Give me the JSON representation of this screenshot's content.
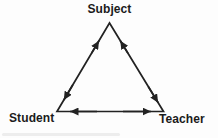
{
  "diagram": {
    "type": "triangle-relationship-diagram",
    "nodes": {
      "top": {
        "label": "Subject"
      },
      "bottom_left": {
        "label": "Student"
      },
      "bottom_right": {
        "label": "Teacher"
      }
    },
    "edges": [
      {
        "from": "Student",
        "to": "Subject",
        "direction": "bidirectional"
      },
      {
        "from": "Teacher",
        "to": "Subject",
        "direction": "bidirectional"
      },
      {
        "from": "Student",
        "to": "Teacher",
        "direction": "bidirectional"
      }
    ],
    "colors": {
      "line": "#222222",
      "text": "#1b1b1b",
      "background": "#fdfdfd"
    }
  }
}
